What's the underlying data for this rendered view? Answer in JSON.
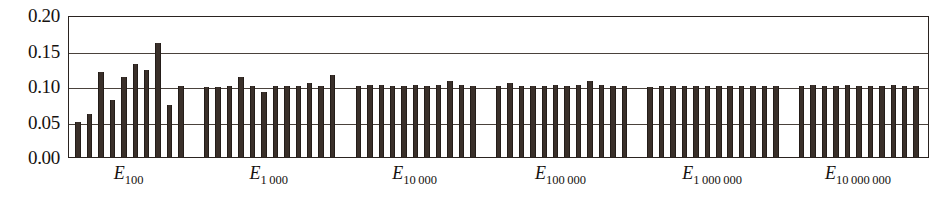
{
  "chart_data": {
    "type": "bar",
    "title": "",
    "subtitle": "",
    "xlabel": "",
    "ylabel": "",
    "ylim": [
      0.0,
      0.2
    ],
    "ytick_labels": [
      "0.00",
      "0.05",
      "0.10",
      "0.15",
      "0.20"
    ],
    "ytick_values": [
      0.0,
      0.05,
      0.1,
      0.15,
      0.2
    ],
    "grid": true,
    "legend": null,
    "bar_color": "#3a302a",
    "axis_color": "#2a2320",
    "grid_color": "#4a423c",
    "background_color": "#ffffff",
    "groups": [
      {
        "label_base": "E",
        "label_sub": "100",
        "values": [
          0.05,
          0.06,
          0.12,
          0.081,
          0.112,
          0.131,
          0.123,
          0.161,
          0.073,
          0.1
        ]
      },
      {
        "label_base": "E",
        "label_sub": "1 000",
        "values": [
          0.099,
          0.099,
          0.1,
          0.112,
          0.1,
          0.091,
          0.1,
          0.1,
          0.1,
          0.104,
          0.1,
          0.116
        ]
      },
      {
        "label_base": "E",
        "label_sub": "10 000",
        "values": [
          0.1,
          0.101,
          0.101,
          0.1,
          0.1,
          0.101,
          0.1,
          0.101,
          0.107,
          0.101,
          0.1
        ]
      },
      {
        "label_base": "E",
        "label_sub": "100 000",
        "values": [
          0.1,
          0.104,
          0.1,
          0.1,
          0.1,
          0.101,
          0.1,
          0.101,
          0.107,
          0.101,
          0.1,
          0.1
        ]
      },
      {
        "label_base": "E",
        "label_sub": "1 000 000",
        "values": [
          0.099,
          0.1,
          0.1,
          0.1,
          0.1,
          0.1,
          0.1,
          0.1,
          0.1,
          0.1,
          0.1,
          0.1
        ]
      },
      {
        "label_base": "E",
        "label_sub": "10 000 000",
        "values": [
          0.1,
          0.101,
          0.1,
          0.1,
          0.101,
          0.1,
          0.1,
          0.1,
          0.101,
          0.1,
          0.1
        ]
      }
    ]
  }
}
